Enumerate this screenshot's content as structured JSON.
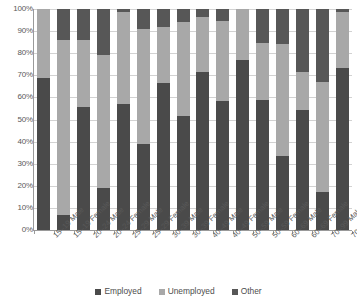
{
  "chart_data": {
    "type": "bar",
    "subtype": "stacked-percentage",
    "title": "",
    "xlabel": "",
    "ylabel": "",
    "ylim": [
      0,
      100
    ],
    "ytick_labels": [
      "100%",
      "90%",
      "80%",
      "70%",
      "60%",
      "50%",
      "40%",
      "30%",
      "20%",
      "10%",
      "0%"
    ],
    "ytick_values": [
      100,
      90,
      80,
      70,
      60,
      50,
      40,
      30,
      20,
      10,
      0
    ],
    "grid": true,
    "legend_position": "bottom",
    "categories": [
      "15–19 Male",
      "15–19 Female",
      "20–24 Male",
      "20–24 Female",
      "25–29 Male",
      "25–29 Female",
      "30–39 Male",
      "30–39 Female",
      "40–49 Male",
      "40–49 Female",
      "50–59 Male",
      "50–59 Female",
      "60–69 Male",
      "60–69 Female",
      "70–99 Male",
      "70–99 Female"
    ],
    "series": [
      {
        "name": "Employed",
        "color": "#4a4a4a",
        "values": [
          69,
          7,
          55.5,
          19,
          57,
          39,
          66.5,
          51.5,
          71.5,
          58.5,
          77,
          59,
          33.5,
          54.5,
          17,
          73.5
        ]
      },
      {
        "name": "Unemployed",
        "color": "#a8a8a8",
        "values": [
          31,
          79,
          30.5,
          60,
          41.5,
          52,
          25.5,
          42.5,
          25,
          36,
          23,
          25.5,
          50.5,
          17,
          50,
          25
        ]
      },
      {
        "name": "Other",
        "color": "#575757",
        "values": [
          0,
          14,
          14,
          21,
          1.5,
          9,
          8,
          6,
          3.5,
          5.5,
          0,
          15.5,
          16,
          28.5,
          33,
          1.5
        ]
      }
    ]
  },
  "legend": {
    "items": [
      {
        "label": "Employed",
        "color": "#4a4a4a",
        "icon": "square-swatch-icon"
      },
      {
        "label": "Unemployed",
        "color": "#a8a8a8",
        "icon": "square-swatch-icon"
      },
      {
        "label": "Other",
        "color": "#575757",
        "icon": "square-swatch-icon"
      }
    ]
  }
}
